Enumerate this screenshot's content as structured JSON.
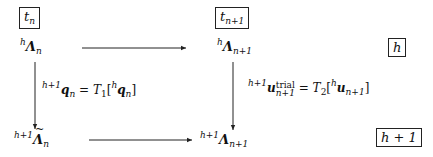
{
  "diagram": {
    "time_labels": {
      "left": {
        "base": "t",
        "sub": "n"
      },
      "right": {
        "base": "t",
        "sub": "n+1"
      }
    },
    "level_labels": {
      "top": "h",
      "bottom": "h + 1"
    },
    "nodes": {
      "top_left": {
        "pre_sup": "h",
        "base": "Λ",
        "sub": "n"
      },
      "top_right": {
        "pre_sup": "h",
        "base": "Λ",
        "sub": "n+1"
      },
      "bottom_left": {
        "pre_sup": "h+1",
        "base": "Λ̃",
        "base_plain": "Λ",
        "accent": "tilde",
        "sub": "n"
      },
      "bottom_right": {
        "pre_sup": "h+1",
        "base": "Λ",
        "sub": "n+1"
      }
    },
    "edges": [
      {
        "from": "top_left",
        "to": "top_right",
        "direction": "right",
        "label": ""
      },
      {
        "from": "top_left",
        "to": "bottom_left",
        "direction": "down",
        "label": {
          "lhs_pre_sup": "h+1",
          "lhs_base": "q",
          "lhs_sub": "n",
          "eq": "=",
          "op": "T",
          "op_sub": "1",
          "arg_pre_sup": "h",
          "arg_base": "q",
          "arg_sub": "n"
        }
      },
      {
        "from": "top_right",
        "to": "bottom_right",
        "direction": "down",
        "label": {
          "lhs_pre_sup": "h+1",
          "lhs_base": "u",
          "lhs_sup": "trial",
          "lhs_sub": "n+1",
          "eq": "=",
          "op": "T",
          "op_sub": "2",
          "arg_pre_sup": "h",
          "arg_base": "u",
          "arg_sub": "n+1"
        }
      },
      {
        "from": "bottom_left",
        "to": "bottom_right",
        "direction": "right",
        "label": ""
      }
    ],
    "colors": {
      "ink": "#111111",
      "background": "#ffffff"
    }
  }
}
